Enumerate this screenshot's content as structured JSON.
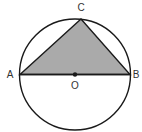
{
  "diagram": {
    "type": "geometry",
    "colors": {
      "stroke": "#1a1a1a",
      "fill": "#aaaaaa",
      "label": "#333333"
    },
    "circle": {
      "center": "O",
      "cx": 75,
      "cy": 74.5,
      "r": 55.5
    },
    "points": [
      {
        "name": "A",
        "label": "A",
        "x": 20,
        "y": 74.5,
        "label_x": 10,
        "label_y": 78
      },
      {
        "name": "B",
        "label": "B",
        "x": 130,
        "y": 74.5,
        "label_x": 136,
        "label_y": 78
      },
      {
        "name": "C",
        "label": "C",
        "x": 81,
        "y": 19,
        "label_x": 81,
        "label_y": 11
      },
      {
        "name": "O",
        "label": "O",
        "x": 75,
        "y": 74.5,
        "label_x": 75,
        "label_y": 89
      }
    ],
    "shaded_polygon": [
      "A",
      "C",
      "B"
    ],
    "segments": [
      [
        "A",
        "B"
      ],
      [
        "A",
        "C"
      ],
      [
        "C",
        "B"
      ]
    ]
  }
}
